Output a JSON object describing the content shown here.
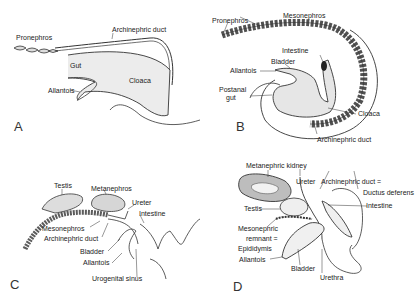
{
  "figure": {
    "panels": [
      {
        "letter": "A",
        "labels": {
          "pronephros": "Pronephros",
          "archinephric_duct": "Archinephric duct",
          "gut": "Gut",
          "cloaca": "Cloaca",
          "allantois": "Allantois"
        }
      },
      {
        "letter": "B",
        "labels": {
          "pronephros": "Pronephros",
          "mesonephros": "Mesonephros",
          "intestine": "Intestine",
          "bladder": "Bladder",
          "allantois": "Allantois",
          "postanal_gut_1": "Postanal",
          "postanal_gut_2": "gut",
          "cloaca": "Cloaca",
          "archinephric_duct": "Archinephric duct"
        }
      },
      {
        "letter": "C",
        "labels": {
          "testis": "Testis",
          "metanephros": "Metanephros",
          "ureter": "Ureter",
          "intestine": "Intestine",
          "mesonephros": "Mesonephros",
          "archinephric_duct": "Archinephric duct",
          "bladder": "Bladder",
          "allantois": "Allantois",
          "urogenital_sinus": "Urogenital sinus"
        }
      },
      {
        "letter": "D",
        "labels": {
          "metanephric_kidney": "Metanephric kidney",
          "ureter": "Ureter",
          "archinephric_duct": "Archinephric duct =",
          "ductus_deferens": "Ductus deferens",
          "intestine": "Intestine",
          "testis": "Testis",
          "mesonephric_remnant_1": "Mesonephric",
          "mesonephric_remnant_2": "remnant =",
          "epididymis": "Epididymis",
          "allantois": "Allantois",
          "bladder": "Bladder",
          "urethra": "Urethra"
        }
      }
    ]
  }
}
